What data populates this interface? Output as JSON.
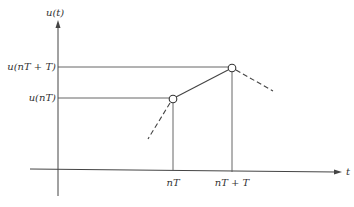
{
  "diagram": {
    "y_axis_label": "u(t)",
    "x_axis_label": "t",
    "y_ticks": [
      {
        "label": "u(nT + T)",
        "y": 67
      },
      {
        "label": "u(nT)",
        "y": 98
      }
    ],
    "x_ticks": [
      {
        "label": "nT",
        "x": 173
      },
      {
        "label": "nT + T",
        "x": 232
      }
    ],
    "points": [
      {
        "name": "u(nT)",
        "x": 173,
        "y": 99
      },
      {
        "name": "u(nT+T)",
        "x": 232,
        "y": 68
      }
    ],
    "line_color": "#444444"
  }
}
